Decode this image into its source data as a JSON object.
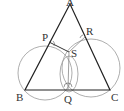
{
  "diagram": {
    "type": "geometry",
    "points": {
      "A": {
        "label": "A",
        "x": 70,
        "y": 4
      },
      "B": {
        "label": "B",
        "x": 25,
        "y": 90
      },
      "C": {
        "label": "C",
        "x": 110,
        "y": 90
      },
      "P": {
        "label": "P",
        "x": 49,
        "y": 42
      },
      "R": {
        "label": "R",
        "x": 86,
        "y": 36
      },
      "S": {
        "label": "S",
        "x": 69,
        "y": 55
      },
      "Q": {
        "label": "Q",
        "x": 68,
        "y": 90
      }
    },
    "colors": {
      "triangle": "#222222",
      "circles": "#888888",
      "labels": "#333333"
    }
  }
}
